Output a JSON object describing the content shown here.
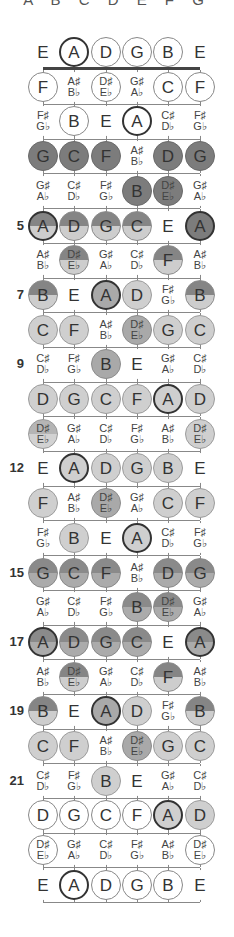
{
  "header": {
    "note_names": "A B C D E F G"
  },
  "strings": [
    "E",
    "A",
    "D",
    "G",
    "B",
    "E"
  ],
  "fret_markers": [
    {
      "fret": 5,
      "label": "5"
    },
    {
      "fret": 7,
      "label": "7"
    },
    {
      "fret": 9,
      "label": "9"
    },
    {
      "fret": 12,
      "label": "12"
    },
    {
      "fret": 15,
      "label": "15"
    },
    {
      "fret": 17,
      "label": "17"
    },
    {
      "fret": 19,
      "label": "19"
    },
    {
      "fret": 21,
      "label": "21"
    }
  ],
  "colors": {
    "dark": "#7c7c7c",
    "mid": "#a9a9a9",
    "light": "#cfcfcf",
    "outline": "#888888",
    "root_border": "#333333"
  },
  "rows": [
    {
      "fret": 0,
      "notes": [
        [
          "E",
          "none"
        ],
        [
          "A",
          "root"
        ],
        [
          "D",
          "outline"
        ],
        [
          "G",
          "outline"
        ],
        [
          "B",
          "outline"
        ],
        [
          "E",
          "none"
        ]
      ]
    },
    {
      "fret": 1,
      "notes": [
        [
          "F",
          "outline"
        ],
        [
          "A♯\nB♭",
          "none"
        ],
        [
          "D♯\nE♭",
          "outline"
        ],
        [
          "G♯\nA♭",
          "none"
        ],
        [
          "C",
          "outline"
        ],
        [
          "F",
          "outline"
        ]
      ]
    },
    {
      "fret": 2,
      "notes": [
        [
          "F♯\nG♭",
          "none"
        ],
        [
          "B",
          "outline"
        ],
        [
          "E",
          "none"
        ],
        [
          "A",
          "root"
        ],
        [
          "C♯\nD♭",
          "none"
        ],
        [
          "F♯\nG♭",
          "none"
        ]
      ]
    },
    {
      "fret": 3,
      "notes": [
        [
          "G",
          "dark"
        ],
        [
          "C",
          "dark"
        ],
        [
          "F",
          "dark"
        ],
        [
          "A♯\nB♭",
          "none"
        ],
        [
          "D",
          "dark"
        ],
        [
          "G",
          "dark"
        ]
      ]
    },
    {
      "fret": 4,
      "notes": [
        [
          "G♯\nA♭",
          "none"
        ],
        [
          "C♯\nD♭",
          "none"
        ],
        [
          "F♯\nG♭",
          "none"
        ],
        [
          "B",
          "dark"
        ],
        [
          "D♯\nE♭",
          "dark"
        ],
        [
          "G♯\nA♭",
          "none"
        ]
      ]
    },
    {
      "fret": 5,
      "notes": [
        [
          "A",
          "split-root"
        ],
        [
          "D",
          "split"
        ],
        [
          "G",
          "split"
        ],
        [
          "C",
          "split"
        ],
        [
          "E",
          "none"
        ],
        [
          "A",
          "dark-root"
        ]
      ]
    },
    {
      "fret": 6,
      "notes": [
        [
          "A♯\nB♭",
          "none"
        ],
        [
          "D♯\nE♭",
          "split"
        ],
        [
          "G♯\nA♭",
          "none"
        ],
        [
          "C♯\nD♭",
          "none"
        ],
        [
          "F",
          "split"
        ],
        [
          "A♯\nB♭",
          "none"
        ]
      ]
    },
    {
      "fret": 7,
      "notes": [
        [
          "B",
          "split"
        ],
        [
          "E",
          "none"
        ],
        [
          "A",
          "mid-root"
        ],
        [
          "D",
          "light"
        ],
        [
          "F♯\nG♭",
          "none"
        ],
        [
          "B",
          "split"
        ]
      ]
    },
    {
      "fret": 8,
      "notes": [
        [
          "C",
          "light"
        ],
        [
          "F",
          "light"
        ],
        [
          "A♯\nB♭",
          "none"
        ],
        [
          "D♯\nE♭",
          "mid"
        ],
        [
          "G",
          "light"
        ],
        [
          "C",
          "light"
        ]
      ]
    },
    {
      "fret": 9,
      "notes": [
        [
          "C♯\nD♭",
          "none"
        ],
        [
          "F♯\nG♭",
          "none"
        ],
        [
          "B",
          "mid"
        ],
        [
          "E",
          "none"
        ],
        [
          "G♯\nA♭",
          "none"
        ],
        [
          "C♯\nD♭",
          "none"
        ]
      ]
    },
    {
      "fret": 10,
      "notes": [
        [
          "D",
          "light"
        ],
        [
          "G",
          "light"
        ],
        [
          "C",
          "light"
        ],
        [
          "F",
          "light"
        ],
        [
          "A",
          "light-root"
        ],
        [
          "D",
          "light"
        ]
      ]
    },
    {
      "fret": 11,
      "notes": [
        [
          "D♯\nE♭",
          "lsplit"
        ],
        [
          "G♯\nA♭",
          "none"
        ],
        [
          "C♯\nD♭",
          "none"
        ],
        [
          "F♯\nG♭",
          "none"
        ],
        [
          "A♯\nB♭",
          "none"
        ],
        [
          "D♯\nE♭",
          "light"
        ]
      ]
    },
    {
      "fret": 12,
      "notes": [
        [
          "E",
          "none"
        ],
        [
          "A",
          "light-root"
        ],
        [
          "D",
          "light"
        ],
        [
          "G",
          "light"
        ],
        [
          "B",
          "light"
        ],
        [
          "E",
          "none"
        ]
      ]
    },
    {
      "fret": 13,
      "notes": [
        [
          "F",
          "light"
        ],
        [
          "A♯\nB♭",
          "none"
        ],
        [
          "D♯\nE♭",
          "mid"
        ],
        [
          "G♯\nA♭",
          "none"
        ],
        [
          "C",
          "light"
        ],
        [
          "F",
          "light"
        ]
      ]
    },
    {
      "fret": 14,
      "notes": [
        [
          "F♯\nG♭",
          "none"
        ],
        [
          "B",
          "light"
        ],
        [
          "E",
          "none"
        ],
        [
          "A",
          "light-root"
        ],
        [
          "C♯\nD♭",
          "none"
        ],
        [
          "F♯\nG♭",
          "none"
        ]
      ]
    },
    {
      "fret": 15,
      "notes": [
        [
          "G",
          "msplit"
        ],
        [
          "C",
          "msplit"
        ],
        [
          "F",
          "msplit"
        ],
        [
          "A♯\nB♭",
          "none"
        ],
        [
          "D",
          "msplit"
        ],
        [
          "G",
          "msplit"
        ]
      ]
    },
    {
      "fret": 16,
      "notes": [
        [
          "G♯\nA♭",
          "none"
        ],
        [
          "C♯\nD♭",
          "none"
        ],
        [
          "F♯\nG♭",
          "none"
        ],
        [
          "B",
          "msplit"
        ],
        [
          "D♯\nE♭",
          "msplit"
        ],
        [
          "G♯\nA♭",
          "none"
        ]
      ]
    },
    {
      "fret": 17,
      "notes": [
        [
          "A",
          "msplit-root"
        ],
        [
          "D",
          "msplit"
        ],
        [
          "G",
          "msplit"
        ],
        [
          "C",
          "msplit"
        ],
        [
          "E",
          "none"
        ],
        [
          "A",
          "msplit-root"
        ]
      ]
    },
    {
      "fret": 18,
      "notes": [
        [
          "A♯\nB♭",
          "none"
        ],
        [
          "D♯\nE♭",
          "split"
        ],
        [
          "G♯\nA♭",
          "none"
        ],
        [
          "C♯\nD♭",
          "none"
        ],
        [
          "F",
          "split"
        ],
        [
          "A♯\nB♭",
          "none"
        ]
      ]
    },
    {
      "fret": 19,
      "notes": [
        [
          "B",
          "split"
        ],
        [
          "E",
          "none"
        ],
        [
          "A",
          "mid-root"
        ],
        [
          "D",
          "light"
        ],
        [
          "F♯\nG♭",
          "none"
        ],
        [
          "B",
          "split"
        ]
      ]
    },
    {
      "fret": 20,
      "notes": [
        [
          "C",
          "light"
        ],
        [
          "F",
          "light"
        ],
        [
          "A♯\nB♭",
          "none"
        ],
        [
          "D♯\nE♭",
          "mid"
        ],
        [
          "G",
          "light"
        ],
        [
          "C",
          "light"
        ]
      ]
    },
    {
      "fret": 21,
      "notes": [
        [
          "C♯\nD♭",
          "none"
        ],
        [
          "F♯\nG♭",
          "none"
        ],
        [
          "B",
          "light"
        ],
        [
          "E",
          "none"
        ],
        [
          "G♯\nA♭",
          "none"
        ],
        [
          "C♯\nD♭",
          "none"
        ]
      ]
    },
    {
      "fret": 22,
      "notes": [
        [
          "D",
          "outline"
        ],
        [
          "G",
          "outline"
        ],
        [
          "C",
          "outline"
        ],
        [
          "F",
          "outline"
        ],
        [
          "A",
          "light-root"
        ],
        [
          "D",
          "light"
        ]
      ]
    },
    {
      "fret": 23,
      "notes": [
        [
          "D♯\nE♭",
          "outline"
        ],
        [
          "G♯\nA♭",
          "none"
        ],
        [
          "C♯\nD♭",
          "none"
        ],
        [
          "F♯\nG♭",
          "none"
        ],
        [
          "A♯\nB♭",
          "none"
        ],
        [
          "D♯\nE♭",
          "outline"
        ]
      ]
    },
    {
      "fret": 24,
      "notes": [
        [
          "E",
          "none"
        ],
        [
          "A",
          "root"
        ],
        [
          "D",
          "outline"
        ],
        [
          "G",
          "outline"
        ],
        [
          "B",
          "outline"
        ],
        [
          "E",
          "none"
        ]
      ]
    }
  ]
}
